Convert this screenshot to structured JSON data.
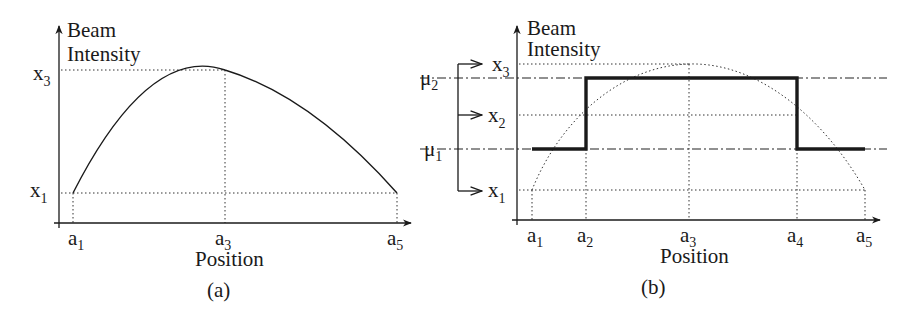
{
  "figure": {
    "panel_a": {
      "caption": "(a)",
      "y_axis_label_line1": "Beam",
      "y_axis_label_line2": "Intensity",
      "x_axis_label": "Position",
      "y_ticks": [
        {
          "base": "x",
          "sub": "3"
        },
        {
          "base": "x",
          "sub": "1"
        }
      ],
      "x_ticks": [
        {
          "base": "a",
          "sub": "1"
        },
        {
          "base": "a",
          "sub": "3"
        },
        {
          "base": "a",
          "sub": "5"
        }
      ],
      "curve": "parabolic beam intensity profile peaking at (a3, x3), endpoints at (a1, x1) and (a5, x1)"
    },
    "panel_b": {
      "caption": "(b)",
      "y_axis_label_line1": "Beam",
      "y_axis_label_line2": "Intensity",
      "x_axis_label": "Position",
      "y_ticks": [
        {
          "base": "x",
          "sub": "3"
        },
        {
          "base": "x",
          "sub": "2"
        },
        {
          "base": "x",
          "sub": "1"
        }
      ],
      "levels": [
        {
          "base": "μ",
          "sub": "2"
        },
        {
          "base": "μ",
          "sub": "1"
        }
      ],
      "x_ticks": [
        {
          "base": "a",
          "sub": "1"
        },
        {
          "base": "a",
          "sub": "2"
        },
        {
          "base": "a",
          "sub": "3"
        },
        {
          "base": "a",
          "sub": "4"
        },
        {
          "base": "a",
          "sub": "5"
        }
      ],
      "step_function": "quantized profile: μ1 on [a1,a2], μ2 on [a2,a4], μ1 on [a4,a5]; dotted original curve behind"
    }
  }
}
